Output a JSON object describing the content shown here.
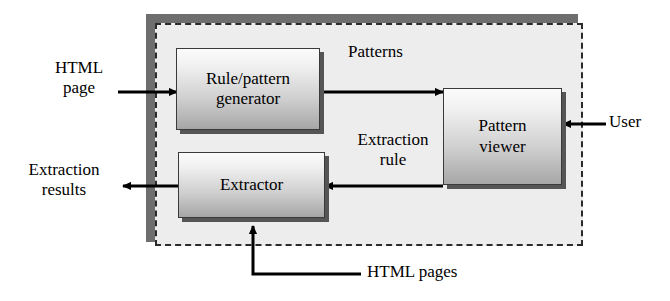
{
  "diagram": {
    "type": "block-flow-diagram",
    "boundary": {
      "name": "system-boundary",
      "style": "dashed",
      "fill": "#ededed",
      "shadow": "#6e6e6e"
    },
    "nodes": [
      {
        "id": "rule-pattern-generator",
        "line1": "Rule/pattern",
        "line2": "generator"
      },
      {
        "id": "pattern-viewer",
        "line1": "Pattern",
        "line2": "viewer"
      },
      {
        "id": "extractor",
        "line1": "Extractor",
        "line2": ""
      }
    ],
    "labels": {
      "html_page_line1": "HTML",
      "html_page_line2": "page",
      "extraction_results_line1": "Extraction",
      "extraction_results_line2": "results",
      "patterns": "Patterns",
      "extraction_rule_line1": "Extraction",
      "extraction_rule_line2": "rule",
      "user": "User",
      "html_pages": "HTML pages"
    },
    "edges": [
      {
        "name": "html-page-to-rule-generator",
        "label": "HTML page",
        "from": "external-input",
        "to": "rule-pattern-generator",
        "direction": "right"
      },
      {
        "name": "rule-generator-to-pattern-viewer",
        "label": "Patterns",
        "from": "rule-pattern-generator",
        "to": "pattern-viewer",
        "direction": "right"
      },
      {
        "name": "pattern-viewer-to-extractor",
        "label": "Extraction rule",
        "from": "pattern-viewer",
        "to": "extractor",
        "direction": "left"
      },
      {
        "name": "extractor-to-extraction-results",
        "label": "Extraction results",
        "from": "extractor",
        "to": "external-output",
        "direction": "left"
      },
      {
        "name": "user-to-pattern-viewer",
        "label": "User",
        "from": "external-user",
        "to": "pattern-viewer",
        "direction": "left"
      },
      {
        "name": "html-pages-to-extractor",
        "label": "HTML pages",
        "from": "external-input",
        "to": "extractor",
        "direction": "up"
      }
    ],
    "colors": {
      "boundary_fill": "#ededed",
      "boundary_shadow": "#6e6e6e",
      "box_top": "#fbfbfb",
      "box_bottom": "#a6a6a6",
      "box_shadow": "#555555",
      "stroke": "#000000"
    }
  }
}
